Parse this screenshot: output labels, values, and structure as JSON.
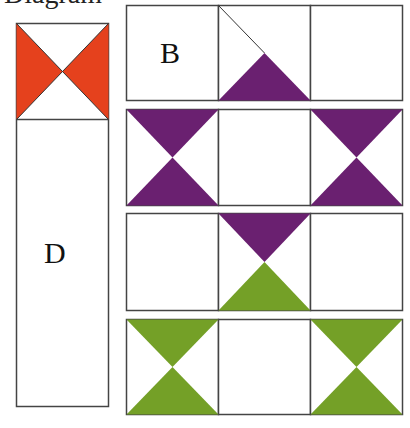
{
  "caption": "Diagram",
  "colors": {
    "red": "#e5411d",
    "purple": "#6a2070",
    "green": "#74a027",
    "outline": "#444444",
    "background": "#ffffff"
  },
  "left_strip": {
    "top_square": {
      "pattern": "hourglass-sides",
      "color": "red"
    },
    "label": "D"
  },
  "rows": [
    {
      "cells": [
        {
          "label": "B",
          "pattern": "blank"
        },
        {
          "pattern": "bottom-triangle-with-diagonal",
          "color": "purple"
        },
        {
          "pattern": "blank"
        }
      ]
    },
    {
      "cells": [
        {
          "pattern": "hourglass-top-bottom",
          "color": "purple"
        },
        {
          "pattern": "blank"
        },
        {
          "pattern": "hourglass-top-bottom",
          "color": "purple"
        }
      ]
    },
    {
      "cells": [
        {
          "pattern": "blank"
        },
        {
          "pattern": "hourglass-top-bottom",
          "top_color": "purple",
          "bottom_color": "green"
        },
        {
          "pattern": "blank"
        }
      ]
    },
    {
      "cells": [
        {
          "pattern": "hourglass-top-bottom",
          "color": "green"
        },
        {
          "pattern": "blank"
        },
        {
          "pattern": "hourglass-top-bottom",
          "color": "green"
        }
      ]
    }
  ]
}
